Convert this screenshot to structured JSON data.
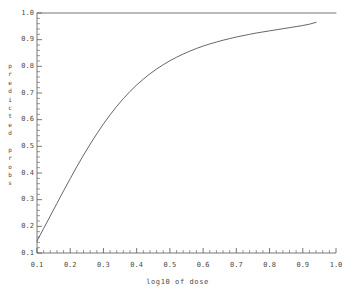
{
  "chart_data": {
    "type": "line",
    "title": "",
    "subtitle": "",
    "xlabel": "log10 of dose",
    "ylabel": "predicted probs",
    "xlim": [
      0.1,
      1.0
    ],
    "ylim": [
      0.1,
      1.0
    ],
    "grid": false,
    "legend": null,
    "legend_position": "none",
    "x_tick_labels": [
      "0.1",
      "0.2",
      "0.3",
      "0.4",
      "0.5",
      "0.6",
      "0.7",
      "0.8",
      "0.9",
      "1.0"
    ],
    "x_tick_values": [
      0.1,
      0.2,
      0.3,
      0.4,
      0.5,
      0.6,
      0.7,
      0.8,
      0.9,
      1.0
    ],
    "y_tick_labels": [
      "0.1",
      "0.2",
      "0.3",
      "0.4",
      "0.5",
      "0.6",
      "0.7",
      "0.8",
      "0.9",
      "1.0"
    ],
    "y_tick_values": [
      0.1,
      0.2,
      0.3,
      0.4,
      0.5,
      0.6,
      0.7,
      0.8,
      0.9,
      1.0
    ],
    "minor_ticks_per_interval": 5,
    "series": [
      {
        "name": "upper asymptote",
        "type": "line",
        "color": "#666666",
        "x": [
          0.1,
          1.0
        ],
        "values": [
          1.0,
          1.0
        ]
      },
      {
        "name": "predicted probability curve",
        "type": "line",
        "color": "#555555",
        "x": [
          0.1,
          0.12,
          0.14,
          0.16,
          0.18,
          0.2,
          0.22,
          0.24,
          0.26,
          0.28,
          0.3,
          0.32,
          0.34,
          0.36,
          0.38,
          0.4,
          0.42,
          0.44,
          0.46,
          0.48,
          0.5,
          0.52,
          0.54,
          0.56,
          0.58,
          0.6,
          0.62,
          0.64,
          0.66,
          0.68,
          0.7,
          0.72,
          0.74,
          0.76,
          0.78,
          0.8,
          0.82,
          0.84,
          0.86,
          0.88,
          0.9,
          0.92,
          0.94
        ],
        "values": [
          0.145,
          0.192,
          0.239,
          0.286,
          0.333,
          0.379,
          0.424,
          0.467,
          0.508,
          0.547,
          0.584,
          0.618,
          0.65,
          0.679,
          0.706,
          0.73,
          0.752,
          0.772,
          0.79,
          0.806,
          0.821,
          0.834,
          0.846,
          0.857,
          0.867,
          0.876,
          0.884,
          0.891,
          0.898,
          0.904,
          0.91,
          0.915,
          0.92,
          0.925,
          0.929,
          0.933,
          0.937,
          0.941,
          0.945,
          0.949,
          0.953,
          0.958,
          0.965
        ]
      }
    ]
  },
  "axes": {
    "x_title": "log10 of dose",
    "y_title_chars": [
      "p",
      "r",
      "e",
      "d",
      "i",
      "c",
      "t",
      "e",
      "d",
      "",
      "p",
      "r",
      "o",
      "b",
      "s"
    ]
  },
  "style": {
    "background": "#ffffff",
    "axis_color": "#555555",
    "curve_color": "#555555",
    "asymptote_color": "#666666",
    "text_color": "#4a4a4a"
  }
}
